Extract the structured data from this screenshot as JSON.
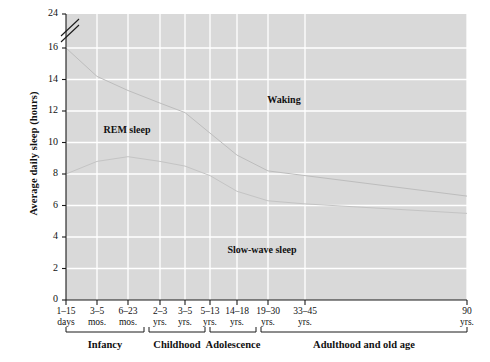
{
  "chart_data": {
    "type": "area",
    "title": "",
    "xlabel": "",
    "ylabel": "Average daily sleep (hours)",
    "ylim": [
      0,
      24
    ],
    "y_ticks": [
      "0",
      "2",
      "4",
      "6",
      "8",
      "10",
      "12",
      "14",
      "16",
      "24"
    ],
    "y_axis_break": {
      "between": [
        16,
        24
      ],
      "symbol": "double-slash"
    },
    "grid": true,
    "legend": "in-plot region labels",
    "x_categories": [
      {
        "line1": "1–15",
        "line2": "days"
      },
      {
        "line1": "3–5",
        "line2": "mos."
      },
      {
        "line1": "6–23",
        "line2": "mos."
      },
      {
        "line1": "2–3",
        "line2": "yrs."
      },
      {
        "line1": "3–5",
        "line2": "yrs."
      },
      {
        "line1": "5–13",
        "line2": "yrs."
      },
      {
        "line1": "14–18",
        "line2": "yrs."
      },
      {
        "line1": "19–30",
        "line2": "yrs."
      },
      {
        "line1": "33–45",
        "line2": "yrs."
      },
      {
        "line1": "90",
        "line2": "yrs."
      }
    ],
    "stages": [
      {
        "label": "Infancy"
      },
      {
        "label": "Childhood"
      },
      {
        "label": "Adolescence"
      },
      {
        "label": "Adulthood and old age"
      }
    ],
    "regions": [
      {
        "name": "Waking",
        "label": "Waking"
      },
      {
        "name": "REM sleep",
        "label": "REM sleep"
      },
      {
        "name": "Slow-wave sleep",
        "label": "Slow-wave sleep"
      }
    ],
    "series": [
      {
        "name": "Total sleep (top of REM band)",
        "values": [
          16.0,
          14.2,
          13.3,
          12.5,
          11.9,
          10.6,
          9.2,
          8.2,
          7.9,
          6.6
        ]
      },
      {
        "name": "Slow-wave + non-REM (top of slow-wave band)",
        "values": [
          8.0,
          8.8,
          9.1,
          8.8,
          8.5,
          7.9,
          6.9,
          6.3,
          6.1,
          5.5
        ]
      }
    ],
    "colors": {
      "plot_background": "#d9d9d9",
      "gridline": "#ffffff",
      "axis": "#1a1a1a",
      "curve": "#b8b8b8",
      "text": "#111111"
    }
  }
}
